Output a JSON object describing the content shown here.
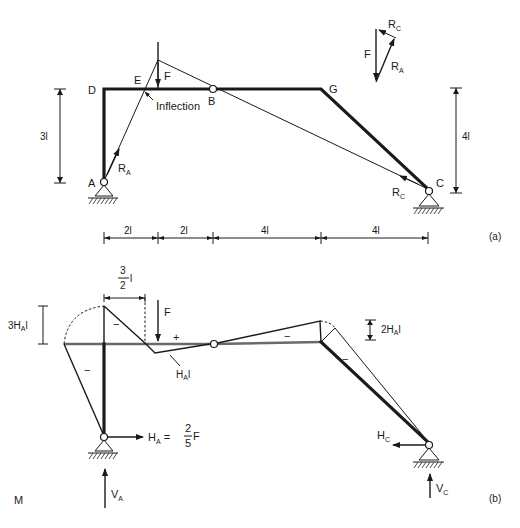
{
  "figure": {
    "part_a": {
      "tag": "(a)",
      "nodes": {
        "A": "A",
        "B": "B",
        "C": "C",
        "D": "D",
        "E": "E",
        "G": "G"
      },
      "load": "F",
      "inflection_label": "Inflection",
      "reaction_A": {
        "main": "R",
        "sub": "A"
      },
      "reaction_C": {
        "main": "R",
        "sub": "C"
      },
      "height_left": "3l",
      "height_right": "4l",
      "spans": [
        "2l",
        "2l",
        "4l",
        "4l"
      ],
      "force_triangle": {
        "F": "F",
        "R_A": {
          "main": "R",
          "sub": "A"
        },
        "R_C": {
          "main": "R",
          "sub": "C"
        }
      }
    },
    "part_b": {
      "tag": "(b)",
      "diagram_label": "M",
      "load": "F",
      "dim_top": {
        "num": "3",
        "den": "2",
        "unit": "l"
      },
      "dim_left": {
        "main": "3H",
        "sub": "A",
        "unit": "l"
      },
      "dim_right": {
        "main": "2H",
        "sub": "A",
        "unit": "l"
      },
      "kink_label": {
        "main": "H",
        "sub": "A",
        "unit": "l"
      },
      "signs": {
        "minus": "−",
        "plus": "+"
      },
      "H_A": {
        "main": "H",
        "sub": "A",
        "eq": "=",
        "num": "2",
        "den": "5",
        "tail": "F"
      },
      "V_A": {
        "main": "V",
        "sub": "A"
      },
      "H_C": {
        "main": "H",
        "sub": "C"
      },
      "V_C": {
        "main": "V",
        "sub": "C"
      }
    }
  }
}
